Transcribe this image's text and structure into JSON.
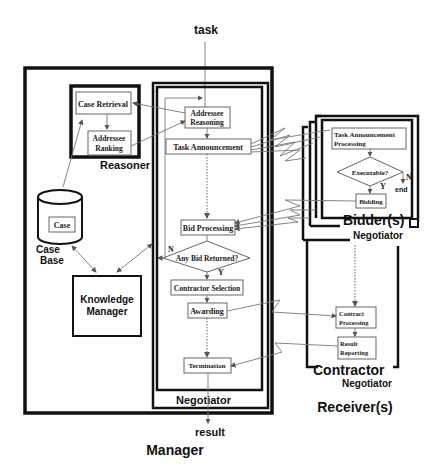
{
  "diagram": {
    "input_label": "task",
    "output_label": "result",
    "manager": {
      "title": "Manager",
      "reasoner": {
        "title": "Reasoner",
        "case_retrieval": "Case Retrieval",
        "addressee_ranking": [
          "Addressee",
          "Ranking"
        ]
      },
      "case_base": {
        "item": "Case",
        "title": [
          "Case",
          "Base"
        ]
      },
      "knowledge_manager": [
        "Knowledge",
        "Manager"
      ],
      "negotiator": {
        "title": "Negotiator",
        "addressee_reasoning": [
          "Addressee",
          "Reasoning"
        ],
        "task_announcement": "Task Announcement",
        "bid_processing": "Bid Processing",
        "any_bid_returned": "Any Bid Returned?",
        "branch_no": "N",
        "branch_yes": "Y",
        "contractor_selection": "Contractor Selection",
        "awarding": "Awarding",
        "termination": "Termination"
      }
    },
    "receivers": {
      "title": "Receiver(s)",
      "bidder": {
        "title": "Bidder(s)",
        "negotiator_title": "Negotiator",
        "task_announcement_processing": [
          "Task Announcement",
          "Processing"
        ],
        "executable": "Executable?",
        "branch_no": "N",
        "branch_yes": "Y",
        "end_label": "end",
        "bidding": "Bidding"
      },
      "contractor": {
        "title": "Contractor",
        "negotiator_title": "Negotiator",
        "contract_processing": [
          "Contract",
          "Processing"
        ],
        "result_reporting": [
          "Result",
          "Reporting"
        ]
      }
    }
  }
}
